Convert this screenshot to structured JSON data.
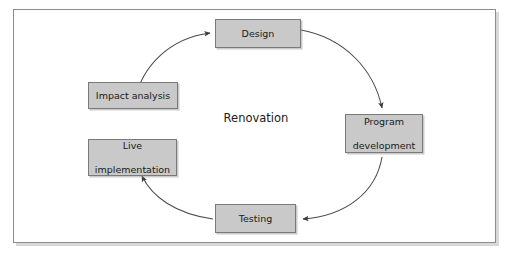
{
  "figure": {
    "center_label": "Renovation",
    "border_color": "#8d8d8d",
    "node_fill": "#c9c9c9",
    "node_border": "#7a7a7a",
    "arrow_color": "#3c3c3c",
    "background": "#ffffff"
  },
  "nodes": [
    {
      "id": "design",
      "label": "Design",
      "lines": [
        "Design"
      ]
    },
    {
      "id": "program",
      "label": "Program development",
      "lines": [
        "Program",
        "development"
      ]
    },
    {
      "id": "testing",
      "label": "Testing",
      "lines": [
        "Testing"
      ]
    },
    {
      "id": "live",
      "label": "Live implementation",
      "lines": [
        "Live",
        "implementation"
      ]
    },
    {
      "id": "impact",
      "label": "Impact analysis",
      "lines": [
        "Impact analysis"
      ]
    }
  ],
  "arrows": [
    {
      "from": "impact",
      "to": "design",
      "direction": "clockwise",
      "arrowhead": "into left edge of Design"
    },
    {
      "from": "design",
      "to": "program",
      "direction": "clockwise",
      "arrowhead": "into top edge of Program development"
    },
    {
      "from": "program",
      "to": "testing",
      "direction": "clockwise",
      "arrowhead": "into right edge of Testing"
    },
    {
      "from": "testing",
      "to": "live",
      "direction": "clockwise",
      "arrowhead": "into bottom right corner of Live implementation"
    }
  ]
}
